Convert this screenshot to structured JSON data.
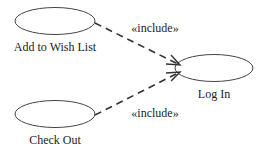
{
  "diagram": {
    "type": "UML use case diagram",
    "use_cases": [
      {
        "id": "add_to_wish_list",
        "label": "Add to Wish List"
      },
      {
        "id": "log_in",
        "label": "Log In"
      },
      {
        "id": "check_out",
        "label": "Check Out"
      }
    ],
    "relationships": [
      {
        "from": "add_to_wish_list",
        "to": "log_in",
        "stereotype": "«include»",
        "style": "dashed",
        "arrow": "open"
      },
      {
        "from": "check_out",
        "to": "log_in",
        "stereotype": "«include»",
        "style": "dashed",
        "arrow": "open"
      }
    ],
    "colors": {
      "stroke": "#333333",
      "text": "#222222",
      "background": "#ffffff"
    }
  }
}
